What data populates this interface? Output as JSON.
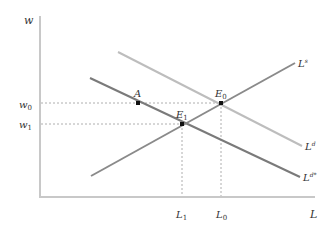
{
  "diagram": {
    "axes": {
      "y_label": "w",
      "x_label": "L"
    },
    "curves": [
      {
        "id": "supply",
        "label": "L",
        "sup": "s",
        "color": "#8a8a8a"
      },
      {
        "id": "demand",
        "label": "L",
        "sup": "d",
        "color": "#bdbdbd"
      },
      {
        "id": "demand_shifted",
        "label": "L",
        "sup": "d*",
        "color": "#7a7a7a"
      }
    ],
    "points": [
      {
        "id": "A",
        "label": "A"
      },
      {
        "id": "E0",
        "label": "E",
        "sub": "0"
      },
      {
        "id": "E1",
        "label": "E",
        "sub": "1"
      }
    ],
    "y_ticks": [
      {
        "label": "w",
        "sub": "0"
      },
      {
        "label": "w",
        "sub": "1"
      }
    ],
    "x_ticks": [
      {
        "label": "L",
        "sub": "1"
      },
      {
        "label": "L",
        "sub": "0"
      }
    ],
    "colors": {
      "axis": "#c8c8c8",
      "guide": "#9a9a9a",
      "point": "#111111"
    }
  }
}
